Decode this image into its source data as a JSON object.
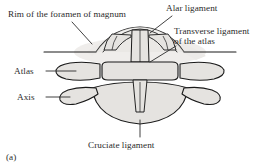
{
  "figure": {
    "caption": "(a)",
    "background_color": "#ffffff",
    "bone_fill_color": "#e5e3e0",
    "shadow_color": "#eceae7",
    "outline_color": "#1a1a1a",
    "text_color": "#2b2b2b",
    "leader_color": "#2b2b2b"
  },
  "labels": {
    "rim": "Rim of the foramen of magnum",
    "alar": "Alar ligament",
    "transverse_line1": "Transverse ligament",
    "transverse_line2": "of the atlas",
    "atlas": "Atlas",
    "axis": "Axis",
    "cruciate": "Cruciate ligament"
  },
  "structures": [
    {
      "name": "foramen-magnum-rim",
      "label_key": "rim"
    },
    {
      "name": "alar-ligament",
      "label_key": "alar"
    },
    {
      "name": "transverse-ligament-of-atlas",
      "label_key": "transverse_line1"
    },
    {
      "name": "atlas-vertebra",
      "label_key": "atlas"
    },
    {
      "name": "axis-vertebra",
      "label_key": "axis"
    },
    {
      "name": "cruciate-ligament",
      "label_key": "cruciate"
    }
  ]
}
